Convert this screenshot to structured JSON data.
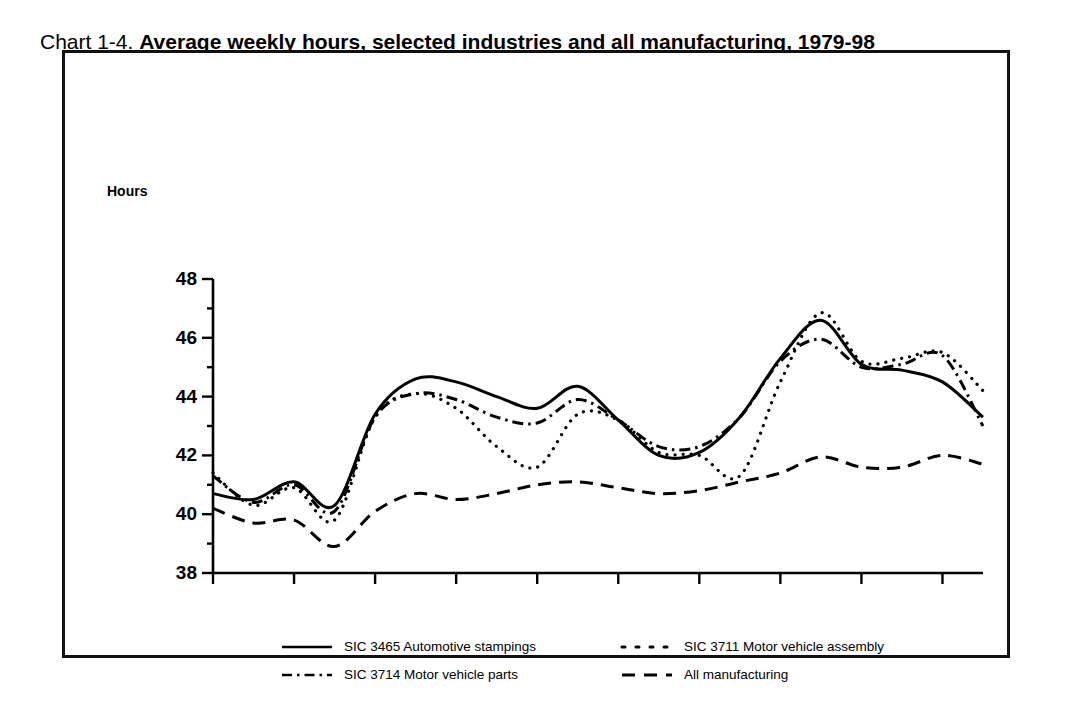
{
  "title": {
    "lead": "Chart 1-4.",
    "bold": "Average weekly hours, selected industries and all manufacturing, 1979-98"
  },
  "axis": {
    "y_label": "Hours",
    "y_ticks": [
      "48",
      "46",
      "44",
      "42",
      "40",
      "38"
    ],
    "x_ticks": [
      "1979",
      "1981",
      "1983",
      "1985",
      "1987",
      "1989",
      "1991",
      "1993",
      "1995",
      "1997"
    ]
  },
  "legend": {
    "items": [
      {
        "label": "SIC 3465 Automotive stampings",
        "style": "solid"
      },
      {
        "label": "SIC 3711 Motor vehicle assembly",
        "style": "dotted"
      },
      {
        "label": "SIC 3714 Motor vehicle parts",
        "style": "dashdot"
      },
      {
        "label": "All manufacturing",
        "style": "dashed"
      }
    ]
  },
  "chart_data": {
    "type": "line",
    "title": "Chart 1-4. Average weekly hours, selected industries and all manufacturing, 1979-98",
    "xlabel": "",
    "ylabel": "Hours",
    "ylim": [
      38,
      48
    ],
    "xlim": [
      1979,
      1998
    ],
    "grid": false,
    "legend_position": "bottom",
    "y_major_step": 2,
    "y_minor_step": 1,
    "x_tick_step": 2,
    "x": [
      1979,
      1980,
      1981,
      1982,
      1983,
      1984,
      1985,
      1986,
      1987,
      1988,
      1989,
      1990,
      1991,
      1992,
      1993,
      1994,
      1995,
      1996,
      1997,
      1998
    ],
    "series": [
      {
        "name": "SIC 3465 Automotive stampings",
        "style": "solid",
        "color": "#000000",
        "values": [
          40.7,
          40.5,
          41.1,
          40.3,
          43.4,
          44.6,
          44.5,
          44.0,
          43.6,
          44.35,
          43.2,
          42.0,
          42.1,
          43.3,
          45.3,
          46.6,
          45.1,
          44.9,
          44.5,
          43.3
        ]
      },
      {
        "name": "SIC 3711 Motor vehicle assembly",
        "style": "dotted",
        "color": "#000000",
        "values": [
          41.4,
          40.3,
          40.9,
          39.8,
          43.3,
          44.1,
          43.6,
          42.3,
          41.6,
          43.4,
          43.2,
          42.1,
          42.0,
          41.3,
          44.5,
          46.85,
          45.2,
          45.3,
          45.5,
          44.2
        ]
      },
      {
        "name": "SIC 3714 Motor vehicle parts",
        "style": "dashdot",
        "color": "#000000",
        "values": [
          41.3,
          40.4,
          41.0,
          40.1,
          43.3,
          44.1,
          43.9,
          43.3,
          43.1,
          43.9,
          43.2,
          42.3,
          42.3,
          43.3,
          45.2,
          45.95,
          45.0,
          45.1,
          45.4,
          43.0
        ]
      },
      {
        "name": "All manufacturing",
        "style": "dashed",
        "color": "#000000",
        "values": [
          40.2,
          39.7,
          39.8,
          38.9,
          40.1,
          40.7,
          40.5,
          40.7,
          41.0,
          41.1,
          40.9,
          40.7,
          40.8,
          41.1,
          41.4,
          41.95,
          41.6,
          41.6,
          42.0,
          41.7
        ]
      }
    ]
  }
}
